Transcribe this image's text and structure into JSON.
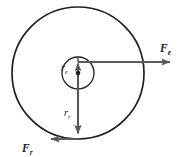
{
  "figure": {
    "background_color": "#ffffff",
    "stroke_color": "#231f20",
    "vector_color": "#58595b",
    "center": {
      "x": 78,
      "y": 73,
      "label": "center-point"
    },
    "circles": [
      {
        "name": "outer-orbit-circle",
        "cx": 78,
        "cy": 73,
        "r": 66,
        "stroke_width": 1.7
      },
      {
        "name": "inner-orbit-circle",
        "cx": 78,
        "cy": 73,
        "r": 16,
        "stroke_width": 1.3
      }
    ],
    "vectors": [
      {
        "name": "radius-electron-vector",
        "label_main": "r",
        "label_sub": "e",
        "from": {
          "x": 78,
          "y": 73
        },
        "to": {
          "x": 78,
          "y": 57
        },
        "direction": "up",
        "label_x": 61,
        "label_y": 70
      },
      {
        "name": "radius-rotation-vector",
        "label_main": "r",
        "label_sub": "r",
        "from": {
          "x": 78,
          "y": 73
        },
        "to": {
          "x": 78,
          "y": 139
        },
        "direction": "down",
        "label_x": 64,
        "label_y": 116
      },
      {
        "name": "force-electron-vector",
        "label_main": "F",
        "label_sub": "e",
        "from": {
          "x": 78,
          "y": 62
        },
        "to": {
          "x": 179,
          "y": 62
        },
        "direction": "right",
        "label_x": 160,
        "label_y": 51
      },
      {
        "name": "force-rotation-vector",
        "label_main": "F",
        "label_sub": "r",
        "from": {
          "x": 79,
          "y": 139
        },
        "to": {
          "x": 42,
          "y": 139
        },
        "direction": "left",
        "label_x": 22,
        "label_y": 152
      }
    ]
  }
}
